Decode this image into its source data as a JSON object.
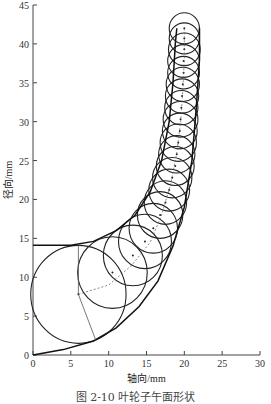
{
  "chart_data": {
    "type": "line",
    "title": "",
    "caption": "图 2-10 叶轮子午面形状",
    "xlabel": "轴向/mm",
    "ylabel": "径向/mm",
    "xlim": [
      0,
      30
    ],
    "ylim": [
      0,
      45
    ],
    "xticks": [
      0,
      5,
      10,
      15,
      20,
      25,
      30
    ],
    "yticks": [
      0,
      5,
      10,
      15,
      20,
      25,
      30,
      35,
      40,
      45
    ],
    "grid": false,
    "series": [
      {
        "name": "shroud",
        "points": [
          [
            0,
            14.1
          ],
          [
            5,
            14.1
          ],
          [
            8,
            14.6
          ],
          [
            11,
            16
          ],
          [
            13.5,
            18
          ],
          [
            15.5,
            21
          ],
          [
            17,
            25
          ],
          [
            18,
            30
          ],
          [
            18.5,
            35
          ],
          [
            18.8,
            40
          ],
          [
            19,
            42
          ]
        ]
      },
      {
        "name": "hub",
        "points": [
          [
            0,
            0
          ],
          [
            4,
            0.7
          ],
          [
            8,
            1.8
          ],
          [
            11,
            3.5
          ],
          [
            14,
            6.2
          ],
          [
            16.5,
            9.5
          ],
          [
            18.5,
            14
          ],
          [
            20,
            19
          ],
          [
            21,
            25
          ],
          [
            21.6,
            32
          ],
          [
            22,
            38
          ],
          [
            22,
            42
          ]
        ]
      },
      {
        "name": "midline",
        "points": [
          [
            6,
            7.8
          ],
          [
            10,
            9
          ],
          [
            13,
            11.5
          ],
          [
            15.5,
            14.5
          ],
          [
            17,
            18
          ],
          [
            18.2,
            22
          ],
          [
            19,
            26
          ],
          [
            19.5,
            30
          ],
          [
            19.8,
            34
          ],
          [
            20,
            38
          ],
          [
            20,
            42
          ]
        ]
      }
    ],
    "circles": [
      {
        "cx": 6.0,
        "cy": 7.8,
        "r": 6.3
      },
      {
        "cx": 10.5,
        "cy": 10.6,
        "r": 4.6
      },
      {
        "cx": 13.2,
        "cy": 12.8,
        "r": 3.9
      },
      {
        "cx": 14.8,
        "cy": 14.6,
        "r": 3.5
      },
      {
        "cx": 15.9,
        "cy": 16.3,
        "r": 3.2
      },
      {
        "cx": 16.8,
        "cy": 18.0,
        "r": 3.0
      },
      {
        "cx": 17.5,
        "cy": 19.6,
        "r": 2.8
      },
      {
        "cx": 18.0,
        "cy": 21.2,
        "r": 2.7
      },
      {
        "cx": 18.4,
        "cy": 22.8,
        "r": 2.6
      },
      {
        "cx": 18.8,
        "cy": 24.3,
        "r": 2.5
      },
      {
        "cx": 19.0,
        "cy": 25.8,
        "r": 2.4
      },
      {
        "cx": 19.2,
        "cy": 27.3,
        "r": 2.4
      },
      {
        "cx": 19.4,
        "cy": 28.8,
        "r": 2.3
      },
      {
        "cx": 19.5,
        "cy": 30.3,
        "r": 2.3
      },
      {
        "cx": 19.6,
        "cy": 31.8,
        "r": 2.2
      },
      {
        "cx": 19.7,
        "cy": 33.3,
        "r": 2.2
      },
      {
        "cx": 19.8,
        "cy": 34.8,
        "r": 2.2
      },
      {
        "cx": 19.9,
        "cy": 36.3,
        "r": 2.1
      },
      {
        "cx": 19.9,
        "cy": 37.8,
        "r": 2.1
      },
      {
        "cx": 20.0,
        "cy": 39.3,
        "r": 2.1
      },
      {
        "cx": 20.0,
        "cy": 40.7,
        "r": 2.0
      },
      {
        "cx": 20.0,
        "cy": 42.0,
        "r": 2.0
      }
    ]
  }
}
